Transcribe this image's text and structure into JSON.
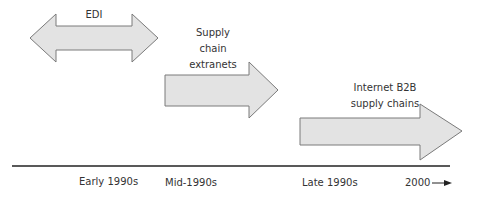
{
  "diagram": {
    "arrows": [
      {
        "id": "edi",
        "label": "EDI",
        "type": "double"
      },
      {
        "id": "extranets",
        "label_lines": [
          "Supply",
          "chain",
          "extranets"
        ],
        "type": "right"
      },
      {
        "id": "internet-b2b",
        "label_lines": [
          "Internet B2B",
          "supply chains"
        ],
        "type": "right"
      }
    ],
    "timeline": {
      "ticks": [
        "Early 1990s",
        "Mid-1990s",
        "Late 1990s",
        "2000"
      ]
    },
    "colors": {
      "arrow_fill": "#e3e3e3",
      "arrow_stroke": "#7a7a7a",
      "line": "#222222"
    }
  }
}
